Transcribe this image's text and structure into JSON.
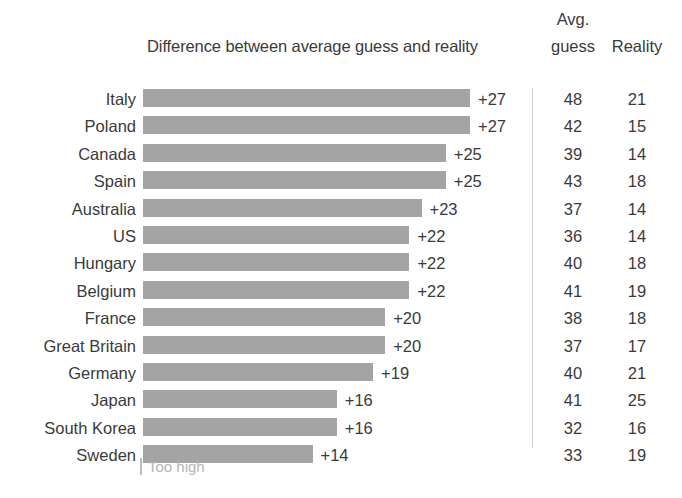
{
  "header": {
    "bar_column_title": "Difference between average guess and reality",
    "avg_label_line1": "Avg.",
    "avg_label_line2": "guess",
    "reality_label": "Reality"
  },
  "legend": {
    "swatch_name": "too-high-swatch",
    "label": "Too high"
  },
  "colors": {
    "bar": "#a4a4a4",
    "text": "#3a3a3a",
    "divider": "#cfcfcf",
    "legend_text": "#b6b6b6",
    "background": "#ffffff"
  },
  "chart_data": {
    "type": "bar",
    "orientation": "horizontal",
    "title": "Difference between average guess and reality",
    "xlabel": "",
    "ylabel": "",
    "grid": false,
    "legend_position": "bottom-left",
    "legend_entries": [
      "Too high"
    ],
    "xlim": [
      0,
      27
    ],
    "columns": [
      "Country",
      "Difference between average guess and reality",
      "Avg. guess",
      "Reality"
    ],
    "categories": [
      "Italy",
      "Poland",
      "Canada",
      "Spain",
      "Australia",
      "US",
      "Hungary",
      "Belgium",
      "France",
      "Great Britain",
      "Germany",
      "Japan",
      "South Korea",
      "Sweden"
    ],
    "values": [
      27,
      27,
      25,
      25,
      23,
      22,
      22,
      22,
      20,
      20,
      19,
      16,
      16,
      14
    ],
    "value_labels": [
      "+27",
      "+27",
      "+25",
      "+25",
      "+23",
      "+22",
      "+22",
      "+22",
      "+20",
      "+20",
      "+19",
      "+16",
      "+16",
      "+14"
    ],
    "series": [
      {
        "name": "Difference between average guess and reality",
        "values": [
          27,
          27,
          25,
          25,
          23,
          22,
          22,
          22,
          20,
          20,
          19,
          16,
          16,
          14
        ]
      },
      {
        "name": "Avg. guess",
        "values": [
          48,
          42,
          39,
          43,
          37,
          36,
          40,
          41,
          38,
          37,
          40,
          41,
          32,
          33
        ]
      },
      {
        "name": "Reality",
        "values": [
          21,
          15,
          14,
          18,
          14,
          14,
          18,
          19,
          18,
          17,
          21,
          25,
          16,
          19
        ]
      }
    ],
    "rows": [
      {
        "country": "Italy",
        "diff": 27,
        "diff_label": "+27",
        "avg_guess": 48,
        "reality": 21
      },
      {
        "country": "Poland",
        "diff": 27,
        "diff_label": "+27",
        "avg_guess": 42,
        "reality": 15
      },
      {
        "country": "Canada",
        "diff": 25,
        "diff_label": "+25",
        "avg_guess": 39,
        "reality": 14
      },
      {
        "country": "Spain",
        "diff": 25,
        "diff_label": "+25",
        "avg_guess": 43,
        "reality": 18
      },
      {
        "country": "Australia",
        "diff": 23,
        "diff_label": "+23",
        "avg_guess": 37,
        "reality": 14
      },
      {
        "country": "US",
        "diff": 22,
        "diff_label": "+22",
        "avg_guess": 36,
        "reality": 14
      },
      {
        "country": "Hungary",
        "diff": 22,
        "diff_label": "+22",
        "avg_guess": 40,
        "reality": 18
      },
      {
        "country": "Belgium",
        "diff": 22,
        "diff_label": "+22",
        "avg_guess": 41,
        "reality": 19
      },
      {
        "country": "France",
        "diff": 20,
        "diff_label": "+20",
        "avg_guess": 38,
        "reality": 18
      },
      {
        "country": "Great Britain",
        "diff": 20,
        "diff_label": "+20",
        "avg_guess": 37,
        "reality": 17
      },
      {
        "country": "Germany",
        "diff": 19,
        "diff_label": "+19",
        "avg_guess": 40,
        "reality": 21
      },
      {
        "country": "Japan",
        "diff": 16,
        "diff_label": "+16",
        "avg_guess": 41,
        "reality": 25
      },
      {
        "country": "South Korea",
        "diff": 16,
        "diff_label": "+16",
        "avg_guess": 32,
        "reality": 16
      },
      {
        "country": "Sweden",
        "diff": 14,
        "diff_label": "+14",
        "avg_guess": 33,
        "reality": 19
      }
    ]
  }
}
